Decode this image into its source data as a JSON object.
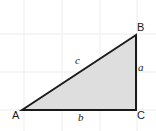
{
  "figure": {
    "kind": "right-triangle-geometry-diagram",
    "background_color": "#ffffff",
    "grid": {
      "visible": true,
      "color": "#f2f2f2",
      "line_width": 1,
      "vertical_x": [
        24,
        62,
        100,
        137
      ],
      "horizontal_y": [
        34,
        72,
        110
      ]
    },
    "triangle": {
      "fill_color": "#dedede",
      "stroke_color": "#1a1a1a",
      "stroke_width": 2,
      "right_angle_at": "C",
      "points": [
        {
          "name": "A",
          "x": 22,
          "y": 110
        },
        {
          "name": "B",
          "x": 136,
          "y": 35
        },
        {
          "name": "C",
          "x": 136,
          "y": 110
        }
      ]
    },
    "vertex_labels": [
      {
        "id": "A",
        "text": "A"
      },
      {
        "id": "B",
        "text": "B"
      },
      {
        "id": "C",
        "text": "C"
      }
    ],
    "side_labels": [
      {
        "id": "a",
        "text": "a",
        "side": "BC"
      },
      {
        "id": "b",
        "text": "b",
        "side": "AC"
      },
      {
        "id": "c",
        "text": "c",
        "side": "AB"
      }
    ]
  }
}
